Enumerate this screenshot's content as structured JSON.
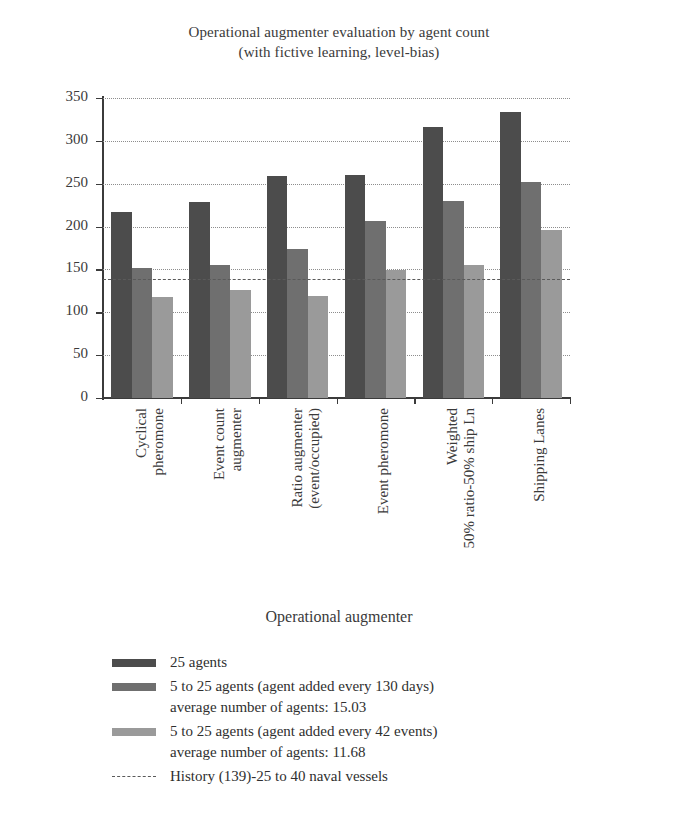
{
  "chart_data": {
    "type": "bar",
    "title": "Operational augmenter evaluation by agent count",
    "subtitle": "(with fictive learning, level-bias)",
    "xlabel": "Operational augmenter",
    "ylabel": "Number of successful events",
    "ylim": [
      0,
      350
    ],
    "yticks": [
      0,
      50,
      100,
      150,
      200,
      250,
      300,
      350
    ],
    "grid": "horizontal-dotted",
    "legend_position": "below",
    "categories": [
      "Cyclical pheromone",
      "Event count augmenter",
      "Ratio augmenter (event/occupied)",
      "Event pheromone",
      "Weighted 50% ratio-50% ship Ln",
      "Shipping Lanes"
    ],
    "category_lines": [
      [
        "Cyclical",
        "pheromone"
      ],
      [
        "Event count",
        "augmenter"
      ],
      [
        "Ratio augmenter",
        "(event/occupied)"
      ],
      [
        "Event pheromone",
        ""
      ],
      [
        "Weighted",
        "50% ratio-50% ship Ln"
      ],
      [
        "Shipping Lanes",
        ""
      ]
    ],
    "series": [
      {
        "name": "25 agents",
        "color": "#4c4c4c",
        "values": [
          217,
          229,
          259,
          260,
          316,
          334
        ]
      },
      {
        "name": "5 to 25 agents (agent added every 130 days)",
        "name_sub": "average number of agents: 15.03",
        "color": "#6f6f6f",
        "values": [
          152,
          155,
          174,
          206,
          230,
          252
        ]
      },
      {
        "name": "5 to 25 agents (agent added every 42 events)",
        "name_sub": "average number of agents: 11.68",
        "color": "#9a9a9a",
        "values": [
          118,
          126,
          119,
          149,
          155,
          196
        ]
      }
    ],
    "reference_line": {
      "label": "History (139)-25 to 40 naval vessels",
      "value": 139,
      "style": "dashed",
      "color": "#5a5a5a"
    }
  },
  "legend": {
    "entries": [
      {
        "label": "25 agents",
        "sub": "",
        "swatch": "#4c4c4c",
        "kind": "swatch"
      },
      {
        "label": "5 to 25 agents (agent added every 130 days)",
        "sub": "average number of agents: 15.03",
        "swatch": "#6f6f6f",
        "kind": "swatch"
      },
      {
        "label": "5 to 25 agents (agent added every 42 events)",
        "sub": "average number of agents: 11.68",
        "swatch": "#9a9a9a",
        "kind": "swatch"
      },
      {
        "label": "History (139)-25 to 40 naval vessels",
        "sub": "",
        "swatch": "#5a5a5a",
        "kind": "dashed"
      }
    ]
  }
}
